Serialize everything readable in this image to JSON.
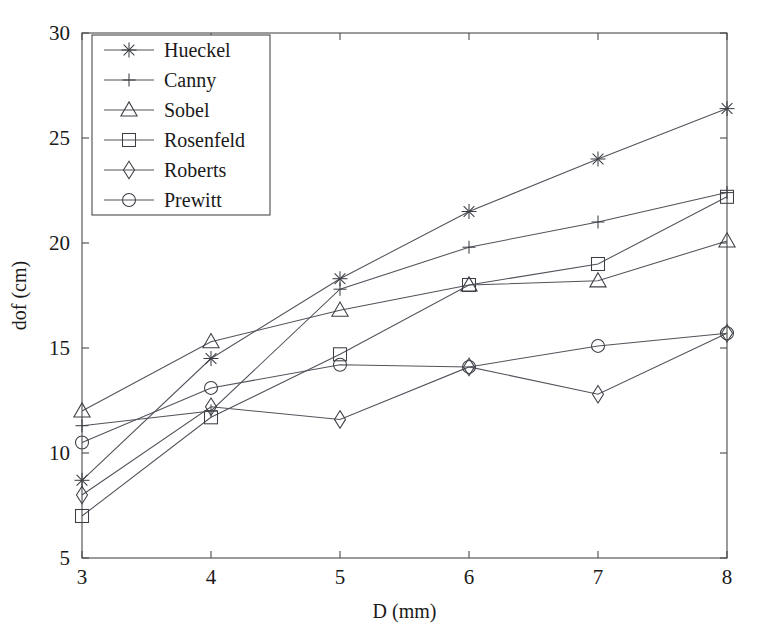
{
  "chart_data": {
    "type": "line",
    "title": "",
    "xlabel": "D (mm)",
    "ylabel": "dof (cm)",
    "x": [
      3,
      4,
      5,
      6,
      7,
      8
    ],
    "xlim": [
      3,
      8
    ],
    "ylim": [
      5,
      30
    ],
    "xticks": [
      3,
      4,
      5,
      6,
      7,
      8
    ],
    "yticks": [
      5,
      10,
      15,
      20,
      25,
      30
    ],
    "xtick_labels": [
      "3",
      "4",
      "5",
      "6",
      "7",
      "8"
    ],
    "ytick_labels": [
      "5",
      "10",
      "15",
      "20",
      "25",
      "30"
    ],
    "grid": false,
    "legend_position": "upper left",
    "series": [
      {
        "name": "Hueckel",
        "marker": "star",
        "values": [
          8.7,
          14.5,
          18.3,
          21.5,
          24.0,
          26.4
        ]
      },
      {
        "name": "Canny",
        "marker": "plus",
        "values": [
          11.3,
          12.0,
          17.8,
          19.8,
          21.0,
          22.4
        ]
      },
      {
        "name": "Sobel",
        "marker": "triangle",
        "values": [
          12.0,
          15.3,
          16.8,
          18.0,
          18.2,
          20.1
        ]
      },
      {
        "name": "Rosenfeld",
        "marker": "square",
        "values": [
          7.0,
          11.7,
          14.7,
          18.0,
          19.0,
          22.2
        ]
      },
      {
        "name": "Roberts",
        "marker": "diamond",
        "values": [
          8.0,
          12.2,
          11.6,
          14.1,
          12.8,
          15.7
        ]
      },
      {
        "name": "Prewitt",
        "marker": "circle",
        "values": [
          10.5,
          13.1,
          14.2,
          14.1,
          15.1,
          15.7
        ]
      }
    ]
  },
  "colors": {
    "line": "#50535a",
    "marker": "#3c3f45",
    "axis": "#4a4a4a",
    "text": "#1a1a1a",
    "background": "#ffffff"
  }
}
